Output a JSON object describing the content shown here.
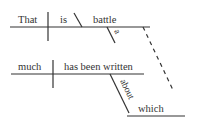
{
  "diagram": {
    "type": "sentence-diagram",
    "clause_main": {
      "subject": "That",
      "verb": "is",
      "complement": "battle",
      "modifier": "a"
    },
    "clause_relative": {
      "subject": "much",
      "verb": "has been written",
      "preposition": "about",
      "object": "which"
    },
    "colors": {
      "line": "#333333",
      "text": "#333333"
    }
  }
}
